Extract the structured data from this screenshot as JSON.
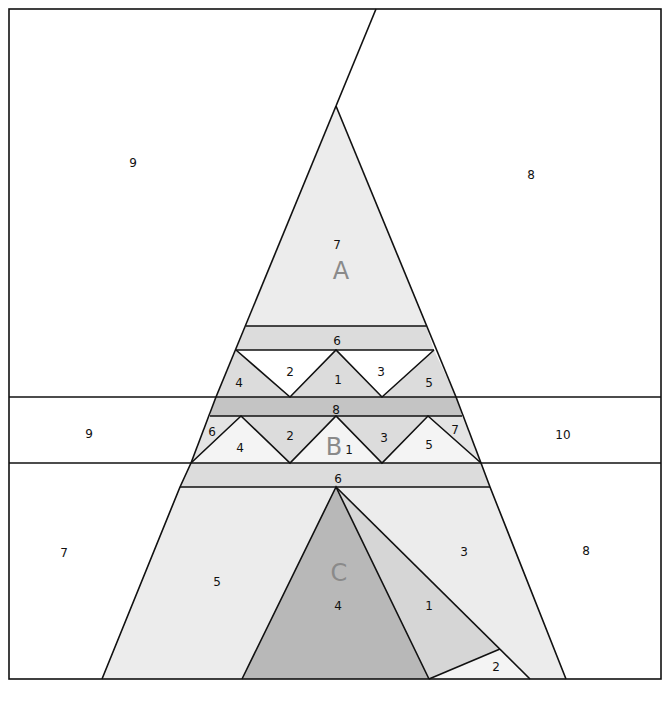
{
  "diagram": {
    "type": "foundation-paper-piecing-pattern",
    "colors": {
      "white": "#ffffff",
      "light": "#ececec",
      "mid": "#dcdcdc",
      "dark": "#c4c4c4",
      "darker": "#b4b4b4",
      "line": "#111111",
      "section_label": "#8a8a8a"
    },
    "sections": {
      "A": {
        "label": "A",
        "pieces": {
          "p1": "1",
          "p2": "2",
          "p3": "3",
          "p4": "4",
          "p5": "5",
          "p6": "6",
          "p7": "7",
          "p8": "8",
          "p9": "9"
        }
      },
      "B": {
        "label": "B",
        "pieces": {
          "p1": "1",
          "p2": "2",
          "p3": "3",
          "p4": "4",
          "p5": "5",
          "p6": "6",
          "p7": "7",
          "p8": "8",
          "p9": "9",
          "p10": "10"
        }
      },
      "C": {
        "label": "C",
        "pieces": {
          "p1": "1",
          "p2": "2",
          "p3": "3",
          "p4": "4",
          "p5": "5",
          "p6": "6",
          "p7": "7",
          "p8": "8"
        }
      }
    }
  }
}
